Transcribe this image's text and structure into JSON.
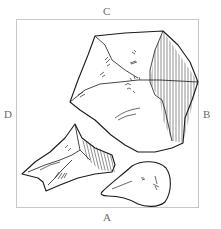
{
  "figure": {
    "labels": {
      "top": "C",
      "right": "B",
      "bottom": "A",
      "left": "D"
    },
    "fragments": [
      {
        "name": "large-fragment",
        "position": "upper-right",
        "shading": "vertical hatching on right facet"
      },
      {
        "name": "triangular-fragment",
        "position": "lower-left",
        "shading": "partial hatching on ridge"
      },
      {
        "name": "pear-shaped-fragment",
        "position": "lower-right",
        "shading": "minimal marks"
      }
    ],
    "colors": {
      "background": "#ffffff",
      "ink": "#1a1a1a",
      "frame": "#c8c8c8",
      "label": "#6a6a6a"
    }
  }
}
